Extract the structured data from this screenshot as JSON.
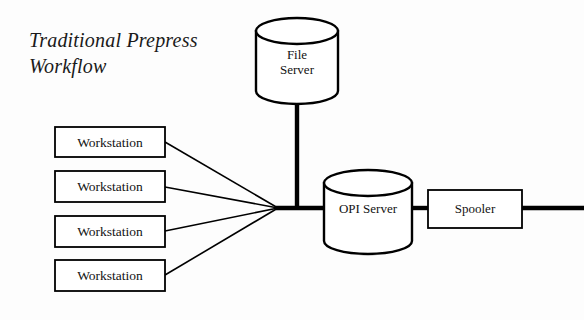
{
  "diagram": {
    "title": "Traditional Prepress\nWorkflow",
    "background_color": "#fdfdfd",
    "line_color": "#000000",
    "text_color": "#121212",
    "nodes": {
      "file_server": {
        "label": "File\nServer",
        "shape": "cylinder",
        "x": 256,
        "y": 18,
        "width": 82,
        "height": 86
      },
      "opi_server": {
        "label": "OPI Server",
        "shape": "cylinder",
        "x": 324,
        "y": 170,
        "width": 88,
        "height": 84
      },
      "spooler": {
        "label": "Spooler",
        "shape": "rectangle",
        "x": 428,
        "y": 190,
        "width": 94,
        "height": 38
      },
      "workstations": [
        {
          "label": "Workstation",
          "shape": "rectangle",
          "x": 55,
          "y": 127,
          "width": 110,
          "height": 30
        },
        {
          "label": "Workstation",
          "shape": "rectangle",
          "x": 55,
          "y": 171,
          "width": 110,
          "height": 31
        },
        {
          "label": "Workstation",
          "shape": "rectangle",
          "x": 55,
          "y": 216,
          "width": 110,
          "height": 31
        },
        {
          "label": "Workstation",
          "shape": "rectangle",
          "x": 55,
          "y": 260,
          "width": 110,
          "height": 31
        }
      ]
    },
    "connections": {
      "junction": {
        "x": 278,
        "y": 208
      },
      "trunk_x": 297,
      "bus_end_x": 584,
      "workstation_link_start_x": 165
    }
  }
}
